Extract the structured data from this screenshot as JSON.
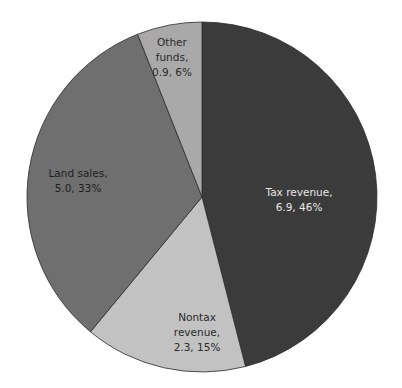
{
  "chart_data": {
    "type": "pie",
    "title": "",
    "unit_hint": "value, percent",
    "categories": [
      "Tax revenue",
      "Nontax revenue",
      "Land sales",
      "Other funds"
    ],
    "values": [
      6.9,
      2.3,
      5.0,
      0.9
    ],
    "percentages": [
      46,
      15,
      33,
      6
    ],
    "colors": [
      "#3b3b3b",
      "#c2c2c2",
      "#6f6f6f",
      "#a9a9a9"
    ],
    "start_angle": "12 o'clock, clockwise",
    "legend": "none (inline labels)"
  },
  "labels": [
    {
      "line1": "Tax revenue,",
      "line2": "6.9, 46%"
    },
    {
      "line1": "Nontax",
      "line2": "revenue,",
      "line3": "2.3, 15%"
    },
    {
      "line1": "Land sales,",
      "line2": "5.0, 33%"
    },
    {
      "line1": "Other",
      "line2": "funds,",
      "line3": "0.9, 6%"
    }
  ]
}
